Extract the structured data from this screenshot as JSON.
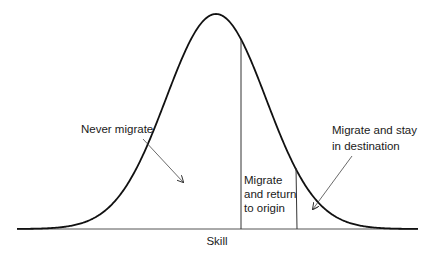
{
  "diagram": {
    "type": "normal-distribution",
    "x_axis_label": "Skill",
    "colors": {
      "curve": "#111111",
      "lines": "#333333",
      "text": "#1a1a1a",
      "background": "#ffffff"
    },
    "curve": {
      "mean_x": 216,
      "peak_y": 14,
      "baseline_y": 229,
      "sigma_px": 50,
      "x_start": 17,
      "x_end": 418
    },
    "thresholds": [
      {
        "name": "return-threshold",
        "x": 241
      },
      {
        "name": "stay-threshold",
        "x": 296
      }
    ],
    "regions": [
      {
        "id": "never",
        "lines": [
          "Never migrate"
        ]
      },
      {
        "id": "return",
        "lines": [
          "Migrate",
          "and return",
          "to origin"
        ]
      },
      {
        "id": "stay",
        "lines": [
          "Migrate and stay",
          "in destination"
        ]
      }
    ]
  }
}
